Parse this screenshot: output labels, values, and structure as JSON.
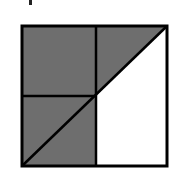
{
  "diagram": {
    "type": "geometric-area-figure",
    "colors": {
      "shade": "#6e6e6e",
      "line": "#000000",
      "background": "#ffffff"
    },
    "square": {
      "x": 22,
      "y": 26,
      "width": 145,
      "height": 140
    },
    "midpoint": {
      "x": 96,
      "y": 96
    },
    "regions": [
      {
        "name": "top-left-quadrant",
        "shaded": true
      },
      {
        "name": "top-right-above-diagonal",
        "shaded": true
      },
      {
        "name": "top-right-below-diagonal",
        "shaded": false
      },
      {
        "name": "bottom-left-quadrant",
        "shaded": true
      },
      {
        "name": "bottom-right-quadrant",
        "shaded": false
      }
    ]
  }
}
